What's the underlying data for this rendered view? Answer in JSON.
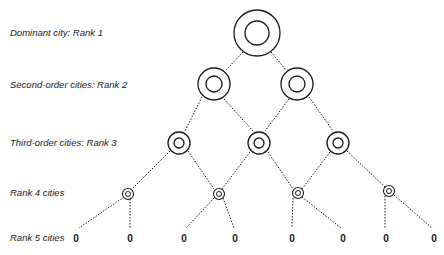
{
  "diagram": {
    "labels": [
      {
        "text": "Dominant city: Rank 1",
        "y": 27
      },
      {
        "text": "Second-order cities: Rank 2",
        "y": 79
      },
      {
        "text": "Third-order cities: Rank 3",
        "y": 137
      },
      {
        "text": "Rank 4 cities",
        "y": 187
      },
      {
        "text": "Rank 5 cities",
        "y": 232
      }
    ],
    "rank5_symbol": "0",
    "colors": {
      "stroke": "#1a1a1a",
      "background": "#ffffff"
    }
  }
}
